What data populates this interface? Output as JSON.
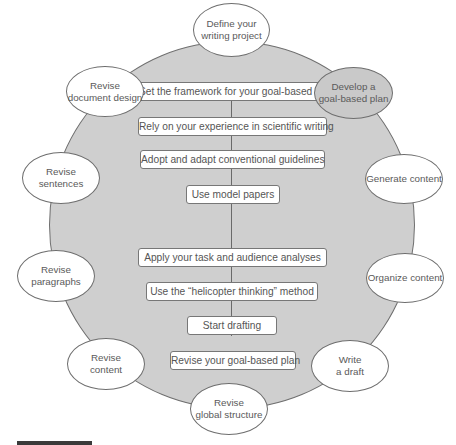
{
  "diagram": {
    "center_steps": [
      "Set the framework for your goal-based plan",
      "Rely on your experience in scientific writing",
      "Adopt and adapt conventional guidelines",
      "Use model papers",
      "Apply your task and audience analyses",
      "Use the “helicopter thinking” method",
      "Start drafting",
      "Revise your goal-based plan"
    ],
    "cycle_nodes": [
      {
        "id": "define",
        "line1": "Define your",
        "line2": "writing project",
        "highlight": false
      },
      {
        "id": "develop",
        "line1": "Develop a",
        "line2": "goal-based plan",
        "highlight": true
      },
      {
        "id": "generate",
        "line1": "Generate content",
        "line2": "",
        "highlight": false
      },
      {
        "id": "organize",
        "line1": "Organize content",
        "line2": "",
        "highlight": false
      },
      {
        "id": "write",
        "line1": "Write",
        "line2": "a draft",
        "highlight": false
      },
      {
        "id": "revise-global",
        "line1": "Revise",
        "line2": "global structure",
        "highlight": false
      },
      {
        "id": "revise-content",
        "line1": "Revise",
        "line2": "content",
        "highlight": false
      },
      {
        "id": "revise-paragraphs",
        "line1": "Revise",
        "line2": "paragraphs",
        "highlight": false
      },
      {
        "id": "revise-sentences",
        "line1": "Revise",
        "line2": "sentences",
        "highlight": false
      },
      {
        "id": "revise-design",
        "line1": "Revise",
        "line2": "document design",
        "highlight": false
      }
    ],
    "colors": {
      "circle_fill": "#cfcfcf",
      "highlight_node": "#c9c9c9",
      "outline": "#6e6e6e"
    }
  }
}
